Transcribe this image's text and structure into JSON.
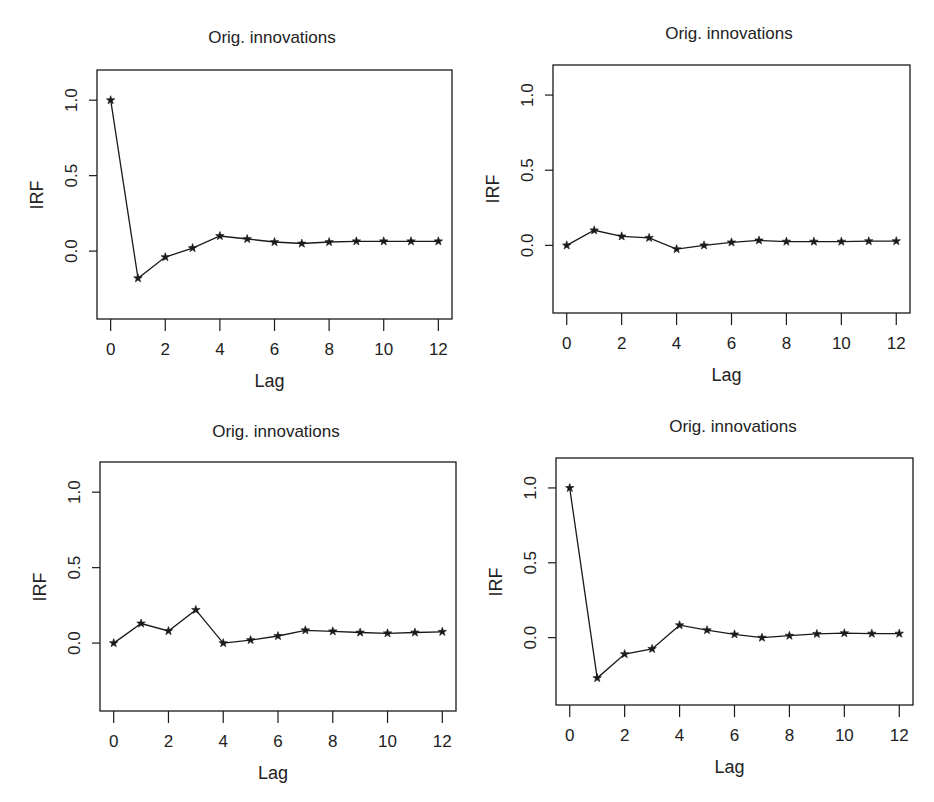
{
  "chart_data": [
    {
      "type": "line",
      "title": "Orig. innovations",
      "xlabel": "Lag",
      "ylabel": "IRF",
      "x": [
        0,
        1,
        2,
        3,
        4,
        5,
        6,
        7,
        8,
        9,
        10,
        11,
        12
      ],
      "series": [
        {
          "name": "IRF",
          "marker": "star",
          "values": [
            1.0,
            -0.18,
            -0.04,
            0.02,
            0.1,
            0.08,
            0.06,
            0.05,
            0.06,
            0.065,
            0.065,
            0.065,
            0.065
          ]
        }
      ],
      "xticks": [
        0,
        2,
        4,
        6,
        8,
        10,
        12
      ],
      "yticks": [
        0.0,
        0.5,
        1.0
      ],
      "ytick_labels": [
        "0.0",
        "0.5",
        "1.0"
      ],
      "xlim": [
        -0.5,
        12.5
      ],
      "ylim": [
        -0.45,
        1.2
      ],
      "grid": false
    },
    {
      "type": "line",
      "title": "Orig. innovations",
      "xlabel": "Lag",
      "ylabel": "IRF",
      "x": [
        0,
        1,
        2,
        3,
        4,
        5,
        6,
        7,
        8,
        9,
        10,
        11,
        12
      ],
      "series": [
        {
          "name": "IRF",
          "marker": "star",
          "values": [
            0.0,
            0.1,
            0.06,
            0.05,
            -0.025,
            0.0,
            0.02,
            0.033,
            0.025,
            0.025,
            0.025,
            0.028,
            0.028
          ]
        }
      ],
      "xticks": [
        0,
        2,
        4,
        6,
        8,
        10,
        12
      ],
      "yticks": [
        0.0,
        0.5,
        1.0
      ],
      "ytick_labels": [
        "0.0",
        "0.5",
        "1.0"
      ],
      "xlim": [
        -0.5,
        12.5
      ],
      "ylim": [
        -0.45,
        1.2
      ],
      "grid": false
    },
    {
      "type": "line",
      "title": "Orig. innovations",
      "xlabel": "Lag",
      "ylabel": "IRF",
      "x": [
        0,
        1,
        2,
        3,
        4,
        5,
        6,
        7,
        8,
        9,
        10,
        11,
        12
      ],
      "series": [
        {
          "name": "IRF",
          "marker": "star",
          "values": [
            0.0,
            0.13,
            0.08,
            0.22,
            0.0,
            0.02,
            0.047,
            0.085,
            0.078,
            0.07,
            0.065,
            0.07,
            0.075
          ]
        }
      ],
      "xticks": [
        0,
        2,
        4,
        6,
        8,
        10,
        12
      ],
      "yticks": [
        0.0,
        0.5,
        1.0
      ],
      "ytick_labels": [
        "0.0",
        "0.5",
        "1.0"
      ],
      "xlim": [
        -0.5,
        12.5
      ],
      "ylim": [
        -0.45,
        1.2
      ],
      "grid": false
    },
    {
      "type": "line",
      "title": "Orig. innovations",
      "xlabel": "Lag",
      "ylabel": "IRF",
      "x": [
        0,
        1,
        2,
        3,
        4,
        5,
        6,
        7,
        8,
        9,
        10,
        11,
        12
      ],
      "series": [
        {
          "name": "IRF",
          "marker": "star",
          "values": [
            1.0,
            -0.27,
            -0.11,
            -0.075,
            0.083,
            0.05,
            0.022,
            0.0,
            0.013,
            0.025,
            0.03,
            0.027,
            0.027
          ]
        }
      ],
      "xticks": [
        0,
        2,
        4,
        6,
        8,
        10,
        12
      ],
      "yticks": [
        0.0,
        0.5,
        1.0
      ],
      "ytick_labels": [
        "0.0",
        "0.5",
        "1.0"
      ],
      "xlim": [
        -0.5,
        12.5
      ],
      "ylim": [
        -0.45,
        1.2
      ],
      "grid": false
    }
  ],
  "layout": {
    "panels": [
      {
        "left": 0,
        "top": 0,
        "box": [
          97,
          70,
          452,
          319
        ],
        "title_x": 272,
        "title_y": 28
      },
      {
        "left": 467,
        "top": 0,
        "box": [
          86,
          65,
          443,
          313
        ],
        "title_x": 262,
        "title_y": 24
      },
      {
        "left": 0,
        "top": 400,
        "box": [
          100,
          62,
          456,
          311
        ],
        "title_x": 276,
        "title_y": 22
      },
      {
        "left": 467,
        "top": 400,
        "box": [
          89,
          58,
          446,
          305
        ],
        "title_x": 266,
        "title_y": 17
      }
    ],
    "line_color": "#1a1a1a",
    "background": "#ffffff"
  }
}
